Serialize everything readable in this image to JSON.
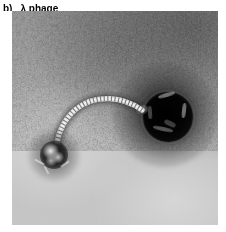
{
  "figure": {
    "panel_letter": "b)",
    "caption": "λ phage",
    "organism": "λ phage",
    "imaging_technique": "transmission electron micrograph, negative stain",
    "background_tone": "#c6c6c6",
    "stain_color": "#0a0a0a"
  },
  "micrograph": {
    "alt": "Negatively stained transmission electron micrograph of a single lambda bacteriophage virion",
    "features": [
      {
        "name": "capsid-head",
        "label": "icosahedral capsid head",
        "center_x": 156,
        "center_y": 106,
        "diameter_px": 50,
        "tone": "#000000"
      },
      {
        "name": "tail-tube",
        "label": "flexible striated tail",
        "start_x": 130,
        "start_y": 99,
        "end_x": 45,
        "end_y": 140,
        "tone": "#e8e8e8"
      },
      {
        "name": "baseplate",
        "label": "tail tip / baseplate",
        "center_x": 42,
        "center_y": 144,
        "diameter_px": 28,
        "tone": "#1a1a1a"
      }
    ]
  }
}
